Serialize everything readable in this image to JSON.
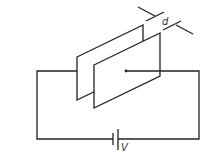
{
  "diagram": {
    "type": "circuit",
    "labels": {
      "separation": "d",
      "voltage": "V"
    },
    "components": [
      {
        "name": "back-plate",
        "kind": "capacitor-plate"
      },
      {
        "name": "front-plate",
        "kind": "capacitor-plate"
      },
      {
        "name": "battery",
        "kind": "dc-source"
      },
      {
        "name": "wire-loop",
        "kind": "wire"
      }
    ],
    "colors": {
      "stroke": "#222222",
      "background": "#ffffff"
    }
  }
}
